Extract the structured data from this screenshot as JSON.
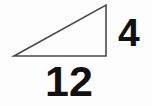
{
  "figure": {
    "type": "right-triangle-diagram",
    "background_color": "#fdfdfd",
    "stroke_color": "#4a4a4a",
    "stroke_width": 1.6,
    "text_color": "#111111",
    "shape": {
      "name": "right-triangle",
      "filled": false,
      "vertices": [
        {
          "name": "left-vertex",
          "x": 14,
          "y": 56
        },
        {
          "name": "bottom-right-vertex",
          "x": 106,
          "y": 56
        },
        {
          "name": "top-right-apex",
          "x": 106,
          "y": 5
        }
      ],
      "edges": [
        {
          "name": "base-edge",
          "from": "left-vertex",
          "to": "bottom-right-vertex",
          "orientation": "horizontal"
        },
        {
          "name": "height-edge",
          "from": "bottom-right-vertex",
          "to": "top-right-apex",
          "orientation": "vertical"
        },
        {
          "name": "hypotenuse-edge",
          "from": "top-right-apex",
          "to": "left-vertex",
          "orientation": "diagonal"
        }
      ]
    },
    "labels": {
      "height": "4",
      "base": "12"
    }
  }
}
